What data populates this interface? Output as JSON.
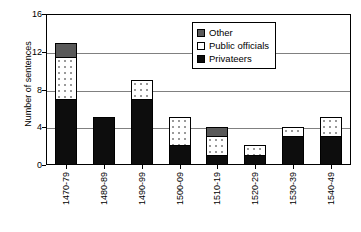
{
  "chart_data": {
    "type": "bar",
    "subtype": "stacked-bar",
    "title": "",
    "xlabel": "",
    "ylabel": "Number of sentences",
    "ylim": [
      0,
      16
    ],
    "yticks": [
      0,
      4,
      8,
      12,
      16
    ],
    "grid": true,
    "legend_position": "upper-right-inside",
    "categories": [
      "1470-79",
      "1480-89",
      "1490-99",
      "1500-09",
      "1510-19",
      "1520-29",
      "1530-39",
      "1540-49"
    ],
    "series": [
      {
        "name": "Privateers",
        "color": "#0d0d0d",
        "values": [
          7,
          5,
          7,
          2,
          1,
          1,
          3,
          3
        ]
      },
      {
        "name": "Public officials",
        "color": "#ffffff",
        "values": [
          4.5,
          0,
          2,
          3,
          2,
          1,
          1,
          2
        ]
      },
      {
        "name": "Other",
        "color": "#595959",
        "values": [
          1.5,
          0,
          0,
          0,
          1,
          0,
          0,
          0
        ]
      }
    ],
    "totals": [
      13,
      5,
      9,
      5,
      4,
      2,
      4,
      5
    ]
  },
  "legend": {
    "items": [
      {
        "label": "Other"
      },
      {
        "label": "Public officials"
      },
      {
        "label": "Privateers"
      }
    ]
  },
  "axes": {
    "y_title": "Number of sentences",
    "y_ticks": [
      "16",
      "12",
      "8",
      "4",
      "0"
    ]
  }
}
